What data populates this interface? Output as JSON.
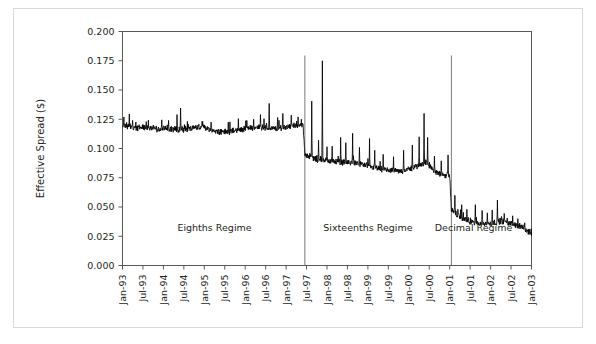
{
  "figure": {
    "background_color": "#ffffff",
    "frame_color": "#d8d8d8",
    "plot_line_color": "#000000",
    "axis_color": "#595959"
  },
  "chart_data": {
    "type": "line",
    "title": "",
    "xlabel": "",
    "ylabel": "Effective Spread ($)",
    "ylim": [
      0.0,
      0.2
    ],
    "ytick_values": [
      0.0,
      0.025,
      0.05,
      0.075,
      0.1,
      0.125,
      0.15,
      0.175,
      0.2
    ],
    "ytick_labels": [
      "0.000",
      "0.025",
      "0.050",
      "0.075",
      "0.100",
      "0.125",
      "0.150",
      "0.175",
      "0.200"
    ],
    "xtick_labels": [
      "Jan-93",
      "Jul-93",
      "Jan-94",
      "Jul-94",
      "Jan-95",
      "Jul-95",
      "Jan-96",
      "Jul-96",
      "Jan-97",
      "Jul-97",
      "Jan-98",
      "Jul-98",
      "Jan-99",
      "Jul-99",
      "Jan-00",
      "Jul-00",
      "Jan-01",
      "Jul-01",
      "Jan-02",
      "Jul-02",
      "Jan-03"
    ],
    "xlim_months": [
      0,
      120
    ],
    "grid": false,
    "legend": null,
    "annotations": [
      {
        "text": "Eighths Regime",
        "x_month": 27,
        "y_value": 0.0295
      },
      {
        "text": "Sixteenths Regime",
        "x_month": 72,
        "y_value": 0.0295
      },
      {
        "text": "Decimal Regime",
        "x_month": 103,
        "y_value": 0.0295
      }
    ],
    "regime_dividers": [
      {
        "label": "eighths-to-sixteenths",
        "x_month": 53.5
      },
      {
        "label": "sixteenths-to-decimal",
        "x_month": 96.5
      }
    ],
    "series": [
      {
        "name": "Effective Spread",
        "color": "#000000",
        "x_unit": "months since Jan-1993",
        "baseline": [
          [
            0,
            0.1205
          ],
          [
            2,
            0.1185
          ],
          [
            4,
            0.1175
          ],
          [
            6,
            0.1172
          ],
          [
            9,
            0.1168
          ],
          [
            12,
            0.1165
          ],
          [
            15,
            0.1162
          ],
          [
            18,
            0.116
          ],
          [
            21,
            0.1175
          ],
          [
            24,
            0.1178
          ],
          [
            27,
            0.115
          ],
          [
            30,
            0.114
          ],
          [
            33,
            0.1148
          ],
          [
            36,
            0.1165
          ],
          [
            39,
            0.118
          ],
          [
            42,
            0.1175
          ],
          [
            45,
            0.1165
          ],
          [
            48,
            0.1185
          ],
          [
            51,
            0.1195
          ],
          [
            53,
            0.119
          ],
          [
            53.5,
            0.095
          ],
          [
            55,
            0.093
          ],
          [
            57,
            0.0905
          ],
          [
            60,
            0.0895
          ],
          [
            63,
            0.0885
          ],
          [
            66,
            0.088
          ],
          [
            69,
            0.087
          ],
          [
            72,
            0.0845
          ],
          [
            75,
            0.0825
          ],
          [
            78,
            0.081
          ],
          [
            81,
            0.08
          ],
          [
            84,
            0.082
          ],
          [
            87,
            0.085
          ],
          [
            89,
            0.088
          ],
          [
            90,
            0.0855
          ],
          [
            92,
            0.079
          ],
          [
            94,
            0.077
          ],
          [
            96,
            0.076
          ],
          [
            96.5,
            0.0465
          ],
          [
            98,
            0.044
          ],
          [
            100,
            0.0395
          ],
          [
            102,
            0.037
          ],
          [
            105,
            0.036
          ],
          [
            108,
            0.0355
          ],
          [
            111,
            0.038
          ],
          [
            114,
            0.0355
          ],
          [
            117,
            0.033
          ],
          [
            119,
            0.029
          ],
          [
            120,
            0.0265
          ]
        ],
        "spikes": [
          [
            0.4,
            0.127
          ],
          [
            2.0,
            0.1295
          ],
          [
            3.0,
            0.124
          ],
          [
            7.0,
            0.123
          ],
          [
            11.5,
            0.1245
          ],
          [
            13.5,
            0.124
          ],
          [
            16.0,
            0.129
          ],
          [
            17.0,
            0.1345
          ],
          [
            23.5,
            0.123
          ],
          [
            26.0,
            0.1225
          ],
          [
            31.0,
            0.1225
          ],
          [
            34.0,
            0.1255
          ],
          [
            36.5,
            0.124
          ],
          [
            38.5,
            0.125
          ],
          [
            40.5,
            0.129
          ],
          [
            41.5,
            0.1255
          ],
          [
            43.0,
            0.1385
          ],
          [
            45.5,
            0.1265
          ],
          [
            47.0,
            0.13
          ],
          [
            49.5,
            0.1285
          ],
          [
            51.5,
            0.127
          ],
          [
            52.5,
            0.125
          ],
          [
            55.5,
            0.1405
          ],
          [
            57.5,
            0.107
          ],
          [
            58.6,
            0.175
          ],
          [
            60.0,
            0.1015
          ],
          [
            61.5,
            0.102
          ],
          [
            64.0,
            0.1095
          ],
          [
            65.5,
            0.105
          ],
          [
            67.5,
            0.113
          ],
          [
            69.5,
            0.101
          ],
          [
            72.5,
            0.1085
          ],
          [
            74.0,
            0.0985
          ],
          [
            76.5,
            0.095
          ],
          [
            79.5,
            0.093
          ],
          [
            82.5,
            0.0985
          ],
          [
            85.0,
            0.103
          ],
          [
            87.0,
            0.11
          ],
          [
            88.5,
            0.13
          ],
          [
            89.5,
            0.1095
          ],
          [
            91.5,
            0.0935
          ],
          [
            93.5,
            0.0895
          ],
          [
            95.5,
            0.0945
          ],
          [
            97.5,
            0.06
          ],
          [
            99.5,
            0.052
          ],
          [
            101.0,
            0.048
          ],
          [
            103.5,
            0.052
          ],
          [
            105.5,
            0.047
          ],
          [
            107.0,
            0.045
          ],
          [
            108.5,
            0.0475
          ],
          [
            110.0,
            0.056
          ],
          [
            112.0,
            0.0445
          ],
          [
            114.5,
            0.0425
          ],
          [
            116.0,
            0.04
          ],
          [
            118.0,
            0.0365
          ]
        ],
        "noise_amplitude": 0.0022,
        "sample_interval_months": 0.08
      }
    ]
  }
}
